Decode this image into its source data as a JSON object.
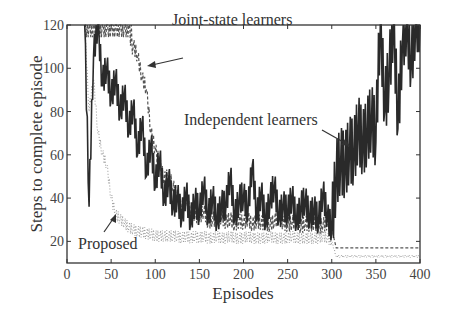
{
  "chart_data": {
    "type": "line",
    "title": "",
    "xlabel": "Episodes",
    "ylabel": "Steps to complete episode",
    "xlim": [
      0,
      400
    ],
    "ylim": [
      10,
      120
    ],
    "xticks": [
      0,
      50,
      100,
      150,
      200,
      250,
      300,
      350,
      400
    ],
    "yticks": [
      20,
      40,
      60,
      80,
      100,
      120
    ],
    "grid": false,
    "legend": "none (inline annotations with arrows)",
    "annotations": [
      {
        "text": "Joint-state learners",
        "arrow_to": [
          85,
          104
        ]
      },
      {
        "text": "Independent learners",
        "arrow_to": [
          348,
          73
        ]
      },
      {
        "text": "Proposed",
        "arrow_to": [
          47,
          32
        ]
      }
    ],
    "x": [
      20,
      25,
      30,
      35,
      40,
      45,
      50,
      55,
      60,
      65,
      70,
      75,
      80,
      85,
      90,
      95,
      100,
      105,
      110,
      115,
      120,
      125,
      130,
      135,
      140,
      145,
      150,
      155,
      160,
      165,
      170,
      175,
      180,
      185,
      190,
      195,
      200,
      205,
      210,
      215,
      220,
      225,
      230,
      235,
      240,
      245,
      250,
      255,
      260,
      265,
      270,
      275,
      280,
      285,
      290,
      295,
      300,
      305,
      310,
      315,
      320,
      325,
      330,
      335,
      340,
      345,
      350,
      355,
      360,
      365,
      370,
      375,
      380,
      385,
      390,
      395,
      400
    ],
    "series": [
      {
        "name": "Independent learners",
        "style": "solid dark",
        "values": [
          120,
          36,
          105,
          120,
          92,
          100,
          85,
          95,
          78,
          88,
          70,
          82,
          60,
          75,
          50,
          65,
          45,
          58,
          38,
          48,
          35,
          40,
          30,
          42,
          28,
          38,
          32,
          45,
          30,
          40,
          28,
          36,
          35,
          50,
          30,
          38,
          40,
          33,
          55,
          30,
          42,
          28,
          38,
          45,
          30,
          36,
          32,
          40,
          28,
          35,
          38,
          30,
          34,
          28,
          42,
          30,
          25,
          48,
          55,
          52,
          60,
          58,
          70,
          62,
          68,
          75,
          66,
          120,
          80,
          95,
          120,
          72,
          110,
          120,
          100,
          120,
          120
        ]
      },
      {
        "name": "Joint-state learners",
        "style": "dashed",
        "values": [
          120,
          120,
          120,
          120,
          120,
          120,
          120,
          120,
          120,
          120,
          120,
          110,
          105,
          95,
          90,
          70,
          62,
          55,
          48,
          50,
          45,
          40,
          35,
          38,
          33,
          32,
          30,
          34,
          28,
          30,
          29,
          31,
          28,
          30,
          27,
          29,
          28,
          30,
          27,
          29,
          28,
          28,
          27,
          29,
          30,
          28,
          27,
          28,
          29,
          26,
          28,
          27,
          28,
          26,
          27,
          28,
          26,
          17,
          17,
          17,
          17,
          17,
          17,
          17,
          17,
          17,
          17,
          17,
          17,
          17,
          17,
          17,
          17,
          17,
          17,
          17,
          17
        ]
      },
      {
        "name": "Proposed",
        "style": "dotted light",
        "values": [
          120,
          80,
          95,
          70,
          60,
          55,
          40,
          32,
          30,
          28,
          26,
          25,
          24,
          24,
          23,
          23,
          22,
          22,
          22,
          22,
          22,
          22,
          21,
          22,
          21,
          22,
          21,
          22,
          21,
          21,
          22,
          21,
          21,
          22,
          21,
          21,
          21,
          22,
          21,
          21,
          21,
          21,
          22,
          21,
          21,
          21,
          21,
          22,
          21,
          21,
          21,
          21,
          21,
          21,
          22,
          21,
          20,
          13,
          13,
          13,
          13,
          13,
          13,
          13,
          13,
          13,
          13,
          13,
          13,
          13,
          13,
          13,
          13,
          13,
          13,
          13,
          13
        ]
      }
    ]
  },
  "labels": {
    "xlabel": "Episodes",
    "ylabel": "Steps to complete episode",
    "anno_joint": "Joint-state learners",
    "anno_indep": "Independent learners",
    "anno_proposed": "Proposed"
  }
}
